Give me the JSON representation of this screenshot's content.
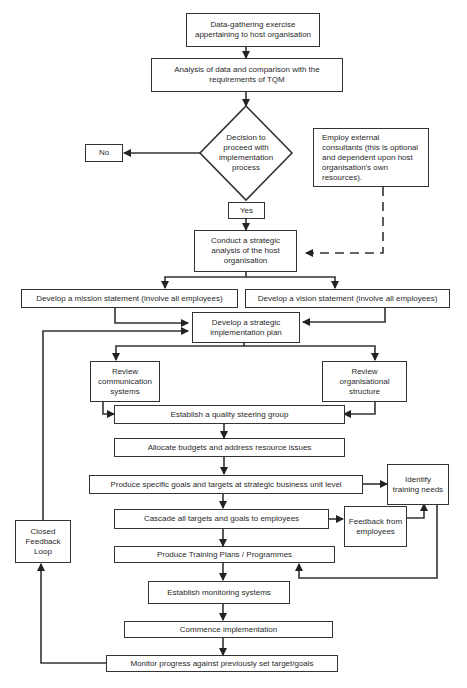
{
  "diagram": {
    "type": "flowchart",
    "nodes": {
      "data_gathering": "Data-gathering exercise appertaining to host organisation",
      "analysis": "Analysis of data and comparison with the requirements of TQM",
      "decision": "Decision to proceed with implementation process",
      "no": "No",
      "yes": "Yes",
      "consultants": "Employ external consultants (this is optional and dependent upon host organisation's own resources).",
      "strategic_analysis": "Conduct a strategic analysis of the host organisation",
      "mission": "Develop a mission statement (involve all employees)",
      "vision": "Develop a vision statement (involve all employees)",
      "strategic_plan": "Develop a strategic implementation plan",
      "review_comm": "Review communication systems",
      "review_org": "Review organisational structure",
      "steering_group": "Establish a quality steering group",
      "budgets": "Allocate budgets and address resource issues",
      "goals_sbu": "Produce specific goals and targets at strategic business unit level",
      "training_needs": "Identify training needs",
      "cascade": "Cascade all targets and goals to employees",
      "feedback": "Feedback from employees",
      "training_plans": "Produce Training Plans / Programmes",
      "monitoring": "Establish monitoring systems",
      "commence": "Commence implementation",
      "monitor_progress": "Monitor progress against previously set target/goals",
      "closed_loop": "Closed Feedback Loop"
    },
    "edges": [
      [
        "data_gathering",
        "analysis"
      ],
      [
        "analysis",
        "decision"
      ],
      [
        "decision",
        "no"
      ],
      [
        "decision",
        "yes"
      ],
      [
        "yes",
        "strategic_analysis"
      ],
      [
        "consultants",
        "strategic_analysis",
        "dashed"
      ],
      [
        "strategic_analysis",
        "mission"
      ],
      [
        "strategic_analysis",
        "vision"
      ],
      [
        "mission",
        "strategic_plan"
      ],
      [
        "vision",
        "strategic_plan"
      ],
      [
        "closed_loop",
        "strategic_plan"
      ],
      [
        "strategic_plan",
        "review_comm"
      ],
      [
        "strategic_plan",
        "review_org"
      ],
      [
        "review_comm",
        "steering_group"
      ],
      [
        "review_org",
        "steering_group"
      ],
      [
        "steering_group",
        "budgets"
      ],
      [
        "budgets",
        "goals_sbu"
      ],
      [
        "goals_sbu",
        "training_needs"
      ],
      [
        "goals_sbu",
        "cascade"
      ],
      [
        "cascade",
        "feedback"
      ],
      [
        "feedback",
        "training_needs"
      ],
      [
        "cascade",
        "training_plans"
      ],
      [
        "training_needs",
        "training_plans"
      ],
      [
        "training_plans",
        "monitoring"
      ],
      [
        "monitoring",
        "commence"
      ],
      [
        "commence",
        "monitor_progress"
      ],
      [
        "monitor_progress",
        "closed_loop"
      ]
    ],
    "colors": {
      "stroke": "#333333",
      "fill": "#ffffff",
      "text": "#2a2a2a"
    }
  }
}
